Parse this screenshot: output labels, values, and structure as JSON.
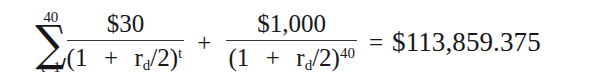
{
  "figure": {
    "kind": "mathematical-equation",
    "background_color": "#ffffff",
    "text_color": "#17171a"
  },
  "equation": {
    "plain_text": "∑(t=1 to 40) $30 / (1 + r_d/2)^t + $1,000 / (1 + r_d/2)^40 = $113,859.375",
    "summation": {
      "glyph": "∑",
      "icon_name": "summation-sigma-icon",
      "upper_limit": "40",
      "lower_limit": "t=1"
    },
    "term_one": {
      "numerator": "$30",
      "denominator_open": "(1",
      "denominator_operator": "+",
      "denominator_rate_base": "r",
      "denominator_rate_subscript": "d",
      "denominator_divisor": "/2)",
      "denominator_exponent": "t"
    },
    "operator_plus": "+",
    "term_two": {
      "numerator": "$1,000",
      "denominator_open": "(1",
      "denominator_operator": "+",
      "denominator_rate_base": "r",
      "denominator_rate_subscript": "d",
      "denominator_divisor": "/2)",
      "denominator_exponent": "40"
    },
    "operator_equals": "=",
    "result": "$113,859.375"
  }
}
